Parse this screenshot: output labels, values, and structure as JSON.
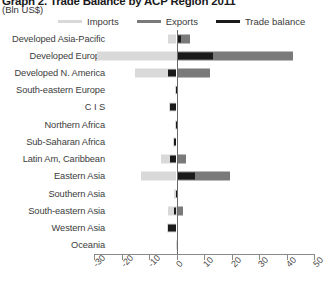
{
  "header": {
    "title": "Graph 2. Trade Balance by ACP Region 2011",
    "subtitle": "(Bln US$)"
  },
  "legend": {
    "position": "top",
    "items": [
      {
        "label": "Imports",
        "color": "#d9d9d9"
      },
      {
        "label": "Exports",
        "color": "#7a7a7a"
      },
      {
        "label": "Trade balance",
        "color": "#1a1a1a"
      }
    ]
  },
  "chart_data": {
    "type": "bar",
    "orientation": "horizontal",
    "title": "Graph 2. Trade Balance by ACP Region 2011",
    "subtitle": "(Bln US$)",
    "xlabel": "",
    "ylabel": "",
    "xlim": [
      -30,
      50
    ],
    "xticks": [
      -30,
      -20,
      -10,
      0,
      10,
      20,
      30,
      40,
      50
    ],
    "xtick_labels": [
      "-30",
      "-20",
      "-10",
      "0",
      "10",
      "20",
      "30",
      "40",
      "50"
    ],
    "grid": false,
    "legend_position": "top",
    "categories": [
      "Developed Asia-Pacific",
      "Developed Europe",
      "Developed N. America",
      "South-eastern Europe",
      "C I S",
      "Northern Africa",
      "Sub-Saharan Africa",
      "Latin Am, Caribbean",
      "Eastern Asia",
      "Southern Asia",
      "South-eastern Asia",
      "Western Asia",
      "Oceania"
    ],
    "series": [
      {
        "name": "Imports",
        "color": "#d9d9d9",
        "values": [
          -3.2,
          -29.0,
          -15.2,
          -0.7,
          -2.6,
          -0.5,
          -1.3,
          -5.8,
          -12.8,
          -0.8,
          -3.0,
          -3.6,
          -0.1
        ]
      },
      {
        "name": "Exports",
        "color": "#7a7a7a",
        "values": [
          5.0,
          42.2,
          12.0,
          0.4,
          0.3,
          0.3,
          0.5,
          3.6,
          19.4,
          0.6,
          2.2,
          0.5,
          0.1
        ]
      },
      {
        "name": "Trade balance",
        "color": "#1a1a1a",
        "values": [
          1.8,
          13.2,
          -3.2,
          -0.3,
          -2.3,
          -0.2,
          -0.8,
          -2.2,
          6.6,
          -0.2,
          -0.8,
          -3.1,
          0.0
        ]
      }
    ]
  }
}
